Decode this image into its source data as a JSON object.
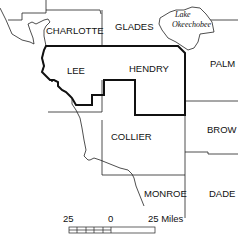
{
  "map": {
    "counties": [
      {
        "id": "charlotte",
        "label": "CHARLOTTE"
      },
      {
        "id": "glades",
        "label": "GLADES"
      },
      {
        "id": "lee",
        "label": "LEE"
      },
      {
        "id": "hendry",
        "label": "HENDRY"
      },
      {
        "id": "palm",
        "label": "PALM"
      },
      {
        "id": "collier",
        "label": "COLLIER"
      },
      {
        "id": "brow",
        "label": "BROW"
      },
      {
        "id": "monroe",
        "label": "MONROE"
      },
      {
        "id": "dade",
        "label": "DADE"
      }
    ],
    "lake": {
      "line1": "Lake",
      "line2": "Okeechobee"
    },
    "highlighted_region": "Lee and Hendry counties",
    "colors": {
      "boundary": "#111111",
      "background": "#ffffff"
    }
  },
  "scale_bar": {
    "left_label": "25",
    "mid_label": "0",
    "right_label": "25 Miles"
  }
}
